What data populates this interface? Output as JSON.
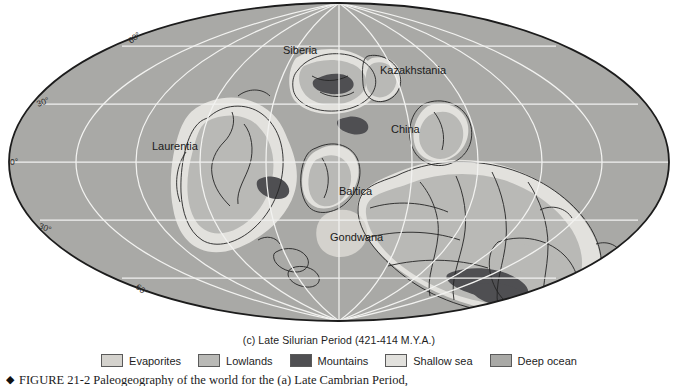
{
  "figure": {
    "subtitle": "(c) Late Silurian Period (421-414 M.Y.A.)",
    "caption_marker": "◆",
    "caption_text": "FIGURE 21-2  Paleogeography of the world for the (a) Late Cambrian Period,",
    "map_projection": "mollweide-ellipse"
  },
  "legend": {
    "items": [
      {
        "label": "Evaporites",
        "color": "#d4d2cd"
      },
      {
        "label": "Lowlands",
        "color": "#b9b9b6"
      },
      {
        "label": "Mountains",
        "color": "#4f4f52"
      },
      {
        "label": "Shallow sea",
        "color": "#e2e1dd"
      },
      {
        "label": "Deep ocean",
        "color": "#a9a9a6"
      }
    ]
  },
  "map": {
    "continent_labels": [
      {
        "name": "Siberia",
        "x": 305,
        "y": 50
      },
      {
        "name": "Kazakhstania",
        "x": 385,
        "y": 70
      },
      {
        "name": "Laurentia",
        "x": 179,
        "y": 146
      },
      {
        "name": "China",
        "x": 400,
        "y": 129
      },
      {
        "name": "Baltica",
        "x": 360,
        "y": 191
      },
      {
        "name": "Gondwana",
        "x": 350,
        "y": 237
      }
    ],
    "latitude_labels": [
      {
        "text": "60°",
        "x": 131,
        "y": 44,
        "rotate": -38
      },
      {
        "text": "30°",
        "x": 41,
        "y": 105,
        "rotate": -22
      },
      {
        "text": "0°",
        "x": 12,
        "y": 163,
        "rotate": 0
      },
      {
        "text": "30°",
        "x": 41,
        "y": 229,
        "rotate": 22
      },
      {
        "text": "60°",
        "x": 138,
        "y": 289,
        "rotate": 38
      }
    ],
    "colors": {
      "deep_ocean": "#a9a9a6",
      "shallow_sea": "#e2e1dd",
      "lowlands": "#b9b9b6",
      "mountains": "#4f4f52",
      "evaporites": "#d4d2cd",
      "graticule": "#f2f2f0",
      "outline": "#1c1c1c",
      "coastline": "#242424",
      "page_background": "#ffffff"
    }
  }
}
